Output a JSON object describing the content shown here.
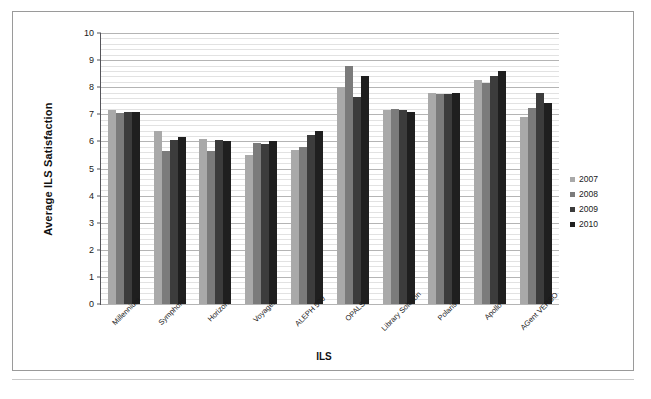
{
  "chart_data": {
    "type": "bar",
    "title": "",
    "xlabel": "ILS",
    "ylabel": "Average ILS Satisfaction",
    "ylim": [
      0,
      10
    ],
    "ytick_step": 1,
    "grid": "horizontal-major-and-minor",
    "legend_position": "right",
    "categories": [
      "Millennium",
      "Symphony",
      "Horizon",
      "Voyager",
      "ALEPH 500",
      "OPALS",
      "Library Solution",
      "Polaris",
      "Apollo",
      "AGent VERSO"
    ],
    "ytick_labels": [
      "0",
      "1",
      "2",
      "3",
      "4",
      "5",
      "6",
      "7",
      "8",
      "9",
      "10"
    ],
    "series": [
      {
        "name": "2007",
        "color": "#a9a9a9",
        "values": [
          7.15,
          6.4,
          6.1,
          5.5,
          5.7,
          8.0,
          7.15,
          7.8,
          8.25,
          6.9
        ]
      },
      {
        "name": "2008",
        "color": "#7b7b7b",
        "values": [
          7.05,
          5.65,
          5.65,
          5.95,
          5.8,
          8.8,
          7.2,
          7.75,
          8.15,
          7.25
        ]
      },
      {
        "name": "2009",
        "color": "#3c3c3c",
        "values": [
          7.1,
          6.05,
          6.05,
          5.9,
          6.25,
          7.65,
          7.15,
          7.75,
          8.4,
          7.8
        ]
      },
      {
        "name": "2010",
        "color": "#1f1f1f",
        "values": [
          7.1,
          6.15,
          6.0,
          6.0,
          6.4,
          8.4,
          7.1,
          7.8,
          8.6,
          7.4
        ]
      }
    ]
  },
  "figure": {
    "caption": ""
  }
}
